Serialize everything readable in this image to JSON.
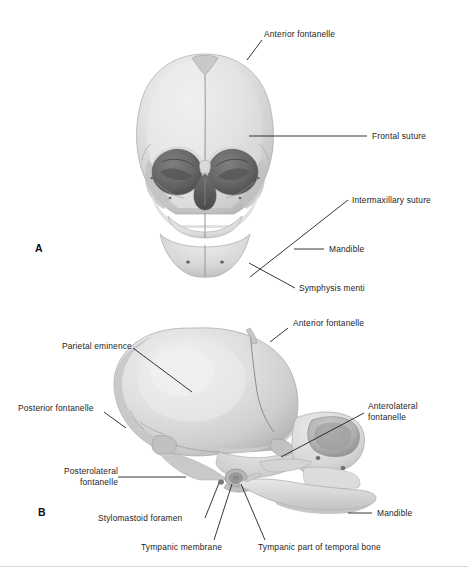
{
  "figure": {
    "background_color": "#ffffff",
    "label_color": "#1d1d1d",
    "leader_color": "#141414",
    "bone_light": "#e9e9e9",
    "bone_mid": "#d2d2d2",
    "bone_shadow": "#b4b4b4",
    "orbit_dark": "#6a6a6a",
    "orbit_deep": "#555555",
    "suture_line": "#8f8f8f",
    "rule_color": "#d9d9d9"
  },
  "panels": [
    {
      "id": "A",
      "letter": "A",
      "view": "anterior",
      "labels": [
        {
          "id": "anterior-fontanelle",
          "text": "Anterior fontanelle"
        },
        {
          "id": "frontal-suture",
          "text": "Frontal suture"
        },
        {
          "id": "intermaxillary-suture",
          "text": "Intermaxillary suture"
        },
        {
          "id": "mandible",
          "text": "Mandible"
        },
        {
          "id": "symphysis-menti",
          "text": "Symphysis menti"
        }
      ]
    },
    {
      "id": "B",
      "letter": "B",
      "view": "lateral",
      "labels": [
        {
          "id": "anterior-fontanelle",
          "text": "Anterior fontanelle"
        },
        {
          "id": "parietal-eminence",
          "text": "Parietal eminence"
        },
        {
          "id": "posterior-fontanelle",
          "text": "Posterior fontanelle"
        },
        {
          "id": "anterolateral-fontanelle",
          "text": "Anterolateral\nfontanelle",
          "line1": "Anterolateral",
          "line2": "fontanelle"
        },
        {
          "id": "posterolateral-fontanelle",
          "text": "Posterolateral\nfontanelle",
          "line1": "Posterolateral",
          "line2": "fontanelle"
        },
        {
          "id": "stylomastoid-foramen",
          "text": "Stylomastoid foramen"
        },
        {
          "id": "tympanic-membrane",
          "text": "Tympanic membrane"
        },
        {
          "id": "tympanic-part-temporal",
          "text": "Tympanic part of temporal bone"
        },
        {
          "id": "mandible",
          "text": "Mandible"
        }
      ]
    }
  ]
}
